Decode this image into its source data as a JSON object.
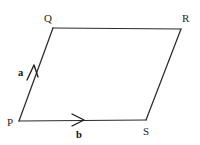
{
  "figure": {
    "kind": "geometry-diagram",
    "shape": "parallelogram",
    "background_color": "#ffffff",
    "stroke_color": "#2b2b2b",
    "label_color": "#262626",
    "vector_label_color": "#111111",
    "vertices": [
      {
        "name": "P",
        "label": "P",
        "x": 19,
        "y": 121,
        "label_x": 7,
        "label_y": 126
      },
      {
        "name": "Q",
        "label": "Q",
        "x": 53,
        "y": 28,
        "label_x": 44,
        "label_y": 22
      },
      {
        "name": "R",
        "label": "R",
        "x": 181,
        "y": 29,
        "label_x": 182,
        "label_y": 22
      },
      {
        "name": "S",
        "label": "S",
        "x": 146,
        "y": 120,
        "label_x": 143,
        "label_y": 135
      }
    ],
    "edges": [
      {
        "name": "edge-P-Q",
        "from": "P",
        "to": "Q",
        "path": "M 19 121 L 53 28"
      },
      {
        "name": "edge-Q-R",
        "from": "Q",
        "to": "R",
        "path": "M 53 28 L 181 29"
      },
      {
        "name": "edge-R-S",
        "from": "R",
        "to": "S",
        "path": "M 181 29 L 146 120"
      },
      {
        "name": "edge-S-P",
        "from": "S",
        "to": "P",
        "path": "M 146 120 L 19 121"
      }
    ],
    "vectors": [
      {
        "name": "vector-a",
        "label": "a",
        "along_edge": "edge-P-Q",
        "direction": "up-right",
        "head_path": "M 27 80 L 34 65 M 38 77 L 34 65",
        "label_x": 18,
        "label_y": 76
      },
      {
        "name": "vector-b",
        "label": "b",
        "along_edge": "edge-P-S",
        "direction": "right",
        "head_path": "M 72 114 L 84 120 M 72 126 L 84 120",
        "label_x": 76,
        "label_y": 138
      }
    ]
  }
}
